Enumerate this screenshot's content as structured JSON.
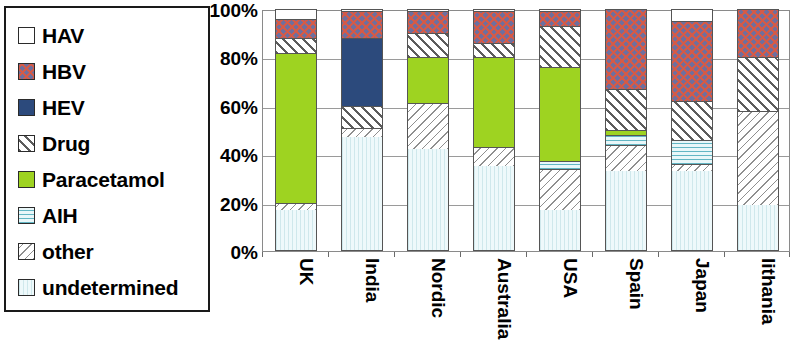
{
  "legend": {
    "items": [
      {
        "label": "HAV",
        "key": "hav",
        "swatch": "white-square-icon"
      },
      {
        "label": "HBV",
        "key": "hbv",
        "swatch": "pink-crosshatch-square-icon"
      },
      {
        "label": "HEV",
        "key": "hev",
        "swatch": "navy-solid-square-icon"
      },
      {
        "label": "Drug",
        "key": "drug",
        "swatch": "diagonal-hatch-square-icon"
      },
      {
        "label": "Paracetamol",
        "key": "para",
        "swatch": "green-solid-square-icon"
      },
      {
        "label": "AIH",
        "key": "aih",
        "swatch": "cyan-horizontal-lines-square-icon"
      },
      {
        "label": "other",
        "key": "other",
        "swatch": "gray-diagonal-square-icon"
      },
      {
        "label": "undetermined",
        "key": "undetermined",
        "swatch": "pale-cyan-square-icon"
      }
    ]
  },
  "chart_data": {
    "type": "bar",
    "stacked": true,
    "title": "",
    "xlabel": "",
    "ylabel": "",
    "ylim": [
      0,
      100
    ],
    "yticks": [
      "0%",
      "20%",
      "40%",
      "60%",
      "80%",
      "100%"
    ],
    "ytick_values": [
      0,
      20,
      40,
      60,
      80,
      100
    ],
    "grid": true,
    "legend_position": "left",
    "categories": [
      "UK",
      "India",
      "Nordic",
      "Australia",
      "USA",
      "Spain",
      "Japan",
      "lithania"
    ],
    "series": [
      {
        "name": "undetermined",
        "key": "undetermined",
        "values": [
          17,
          47,
          42,
          35,
          17,
          33,
          33,
          19
        ]
      },
      {
        "name": "other",
        "key": "other",
        "values": [
          3,
          4,
          19,
          8,
          17,
          11,
          3,
          39
        ]
      },
      {
        "name": "AIH",
        "key": "aih",
        "values": [
          0,
          0,
          0,
          0,
          3,
          4,
          10,
          0
        ]
      },
      {
        "name": "Paracetamol",
        "key": "para",
        "values": [
          62,
          0,
          19,
          37,
          39,
          2,
          0,
          0
        ]
      },
      {
        "name": "Drug",
        "key": "drug",
        "values": [
          6,
          9,
          10,
          6,
          17,
          17,
          16,
          22
        ]
      },
      {
        "name": "HEV",
        "key": "hev",
        "values": [
          0,
          28,
          0,
          0,
          0,
          0,
          0,
          0
        ]
      },
      {
        "name": "HBV",
        "key": "hbv",
        "values": [
          8,
          11,
          9,
          13,
          6,
          33,
          33,
          20
        ]
      },
      {
        "name": "HAV",
        "key": "hav",
        "values": [
          4,
          1,
          1,
          1,
          1,
          0,
          5,
          0
        ]
      }
    ]
  },
  "colors": {
    "hav": "#ffffff",
    "hbv": "#6f6f9e",
    "hev": "#2c4a7c",
    "drug": "#ffffff",
    "para": "#9ed321",
    "aih": "#e2f4f6",
    "other": "#fafafa",
    "undetermined": "#e8f5f7",
    "axis": "#8a8a8a",
    "text": "#000000"
  }
}
